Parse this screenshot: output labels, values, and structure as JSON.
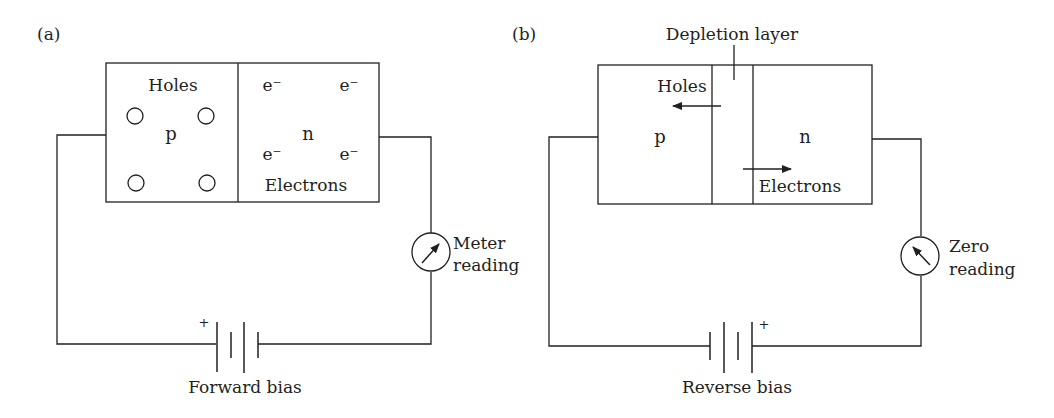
{
  "figure": {
    "panels": [
      {
        "id": "a",
        "label": "(a)",
        "regions": {
          "p_label": "p",
          "n_label": "n",
          "holes_label": "Holes",
          "electrons_label": "Electrons",
          "electron_symbol": "e⁻",
          "hole_count": 4,
          "electron_count": 4
        },
        "meter": {
          "label_line1": "Meter",
          "label_line2": "reading",
          "needle": "deflected-right"
        },
        "battery": {
          "plus_sign": "+",
          "plus_side": "left"
        },
        "caption": "Forward bias"
      },
      {
        "id": "b",
        "label": "(b)",
        "regions": {
          "p_label": "p",
          "n_label": "n",
          "holes_label": "Holes",
          "electrons_label": "Electrons",
          "depletion_label": "Depletion layer",
          "holes_arrow": "left",
          "electrons_arrow": "right"
        },
        "meter": {
          "label_line1": "Zero",
          "label_line2": "reading",
          "needle": "deflected-left"
        },
        "battery": {
          "plus_sign": "+",
          "plus_side": "right"
        },
        "caption": "Reverse bias"
      }
    ]
  }
}
